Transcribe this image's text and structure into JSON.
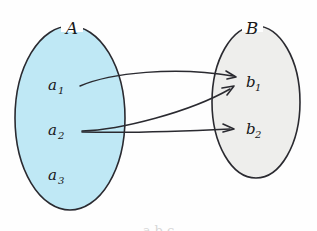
{
  "figure": {
    "type": "set-mapping-diagram",
    "background_color": "#fefefe",
    "stroke_color": "#2a2a30",
    "caption_fragment": "a b c"
  },
  "sets": [
    {
      "id": "A",
      "label": "A",
      "fill_color": "#bfe8f5",
      "stroke_color": "#2a2a30",
      "cx": 70,
      "cy": 118,
      "rx": 55,
      "ry": 92,
      "label_x": 72,
      "label_y": 34,
      "elements": [
        {
          "base": "a",
          "sub": "1",
          "x": 48,
          "y": 90,
          "cx": 82,
          "cy": 85
        },
        {
          "base": "a",
          "sub": "2",
          "x": 48,
          "y": 135,
          "cx": 82,
          "cy": 130
        },
        {
          "base": "a",
          "sub": "3",
          "x": 48,
          "y": 180,
          "cx": 82,
          "cy": 175
        }
      ]
    },
    {
      "id": "B",
      "label": "B",
      "fill_color": "#eeeeec",
      "stroke_color": "#2a2a30",
      "cx": 256,
      "cy": 102,
      "rx": 44,
      "ry": 76,
      "label_x": 252,
      "label_y": 34,
      "elements": [
        {
          "base": "b",
          "sub": "1",
          "x": 246,
          "y": 87,
          "cx": 243,
          "cy": 82
        },
        {
          "base": "b",
          "sub": "2",
          "x": 246,
          "y": 134,
          "cx": 243,
          "cy": 129
        }
      ]
    }
  ],
  "arrows": [
    {
      "id": "a1-to-b1",
      "from": "a1",
      "to": "b1",
      "path": "M 80,86 C 110,73 175,66 233,76",
      "head_x": 236,
      "head_y": 77,
      "head_angle": 11
    },
    {
      "id": "a2-to-b1",
      "from": "a2",
      "to": "b1",
      "path": "M 82,131 C 120,130 190,112 230,89",
      "head_x": 234,
      "head_y": 86,
      "head_angle": -32
    },
    {
      "id": "a2-to-b2",
      "from": "a2",
      "to": "b2",
      "path": "M 82,132 C 125,133 190,131 230,129",
      "head_x": 234,
      "head_y": 129,
      "head_angle": -1
    }
  ]
}
